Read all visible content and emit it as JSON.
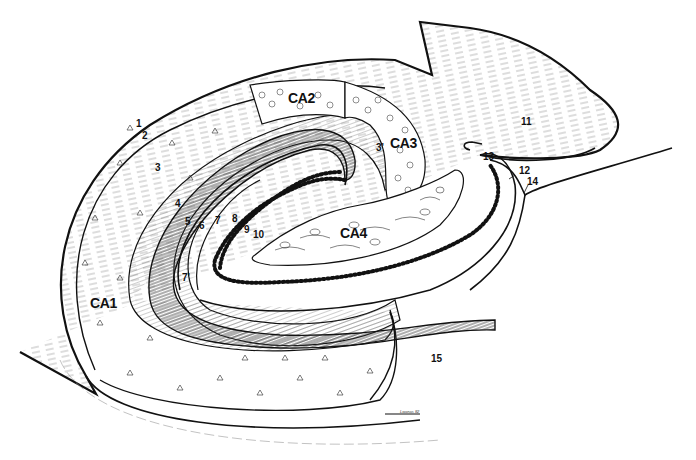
{
  "diagram": {
    "type": "anatomical-line-drawing",
    "colors": {
      "ink": "#111111",
      "background": "#ffffff",
      "hatch": "#555555"
    },
    "regions": [
      {
        "id": "CA1",
        "label": "CA1",
        "x": 90,
        "y": 296
      },
      {
        "id": "CA2",
        "label": "CA2",
        "x": 288,
        "y": 91
      },
      {
        "id": "CA3",
        "label": "CA3",
        "x": 390,
        "y": 138
      },
      {
        "id": "CA4",
        "label": "CA4",
        "x": 340,
        "y": 228
      }
    ],
    "numbered_labels": [
      {
        "label": "1",
        "x": 136,
        "y": 119
      },
      {
        "label": "2",
        "x": 142,
        "y": 131
      },
      {
        "label": "3",
        "x": 155,
        "y": 163
      },
      {
        "label": "3'",
        "x": 376,
        "y": 143
      },
      {
        "label": "4",
        "x": 175,
        "y": 199
      },
      {
        "label": "5",
        "x": 185,
        "y": 217
      },
      {
        "label": "6",
        "x": 199,
        "y": 221
      },
      {
        "label": "7",
        "x": 215,
        "y": 216
      },
      {
        "label": "7'",
        "x": 182,
        "y": 273
      },
      {
        "label": "8",
        "x": 232,
        "y": 214
      },
      {
        "label": "9",
        "x": 244,
        "y": 225
      },
      {
        "label": "10",
        "x": 253,
        "y": 230
      },
      {
        "label": "11",
        "x": 521,
        "y": 117
      },
      {
        "label": "12",
        "x": 519,
        "y": 166
      },
      {
        "label": "13",
        "x": 483,
        "y": 152
      },
      {
        "label": "14",
        "x": 527,
        "y": 177
      },
      {
        "label": "15",
        "x": 431,
        "y": 354
      }
    ],
    "signature": {
      "text": "Lwanas 82",
      "x": 400,
      "y": 410
    }
  }
}
